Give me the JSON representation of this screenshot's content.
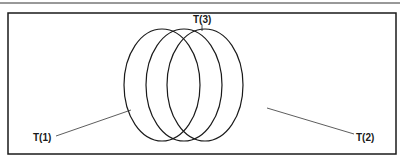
{
  "diagram": {
    "type": "overlapping-ellipses",
    "stroke_color": "#1a1a1a",
    "background": "#ffffff",
    "ellipses": [
      {
        "id": "T(1)",
        "cx": 162,
        "cy": 85,
        "rx": 38,
        "ry": 56
      },
      {
        "id": "T(3)",
        "cx": 184,
        "cy": 85,
        "rx": 38,
        "ry": 56
      },
      {
        "id": "T(2)",
        "cx": 205,
        "cy": 85,
        "rx": 38,
        "ry": 56
      }
    ],
    "labels": {
      "t1": "T(1)",
      "t2": "T(2)",
      "t3": "T(3)"
    }
  }
}
